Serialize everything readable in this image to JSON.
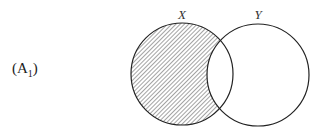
{
  "diagram": {
    "type": "venn",
    "panel_label": {
      "main": "(A",
      "subscript": "1",
      "close": ")"
    },
    "sets": [
      {
        "name": "X",
        "cx": 182,
        "cy": 74,
        "r": 51,
        "shaded": "X minus Y"
      },
      {
        "name": "Y",
        "cx": 258,
        "cy": 75,
        "r": 51,
        "shaded": "none"
      }
    ],
    "shaded_region": "X \\ Y",
    "colors": {
      "stroke": "#222222",
      "hatch": "#555555",
      "background": "#ffffff"
    }
  }
}
